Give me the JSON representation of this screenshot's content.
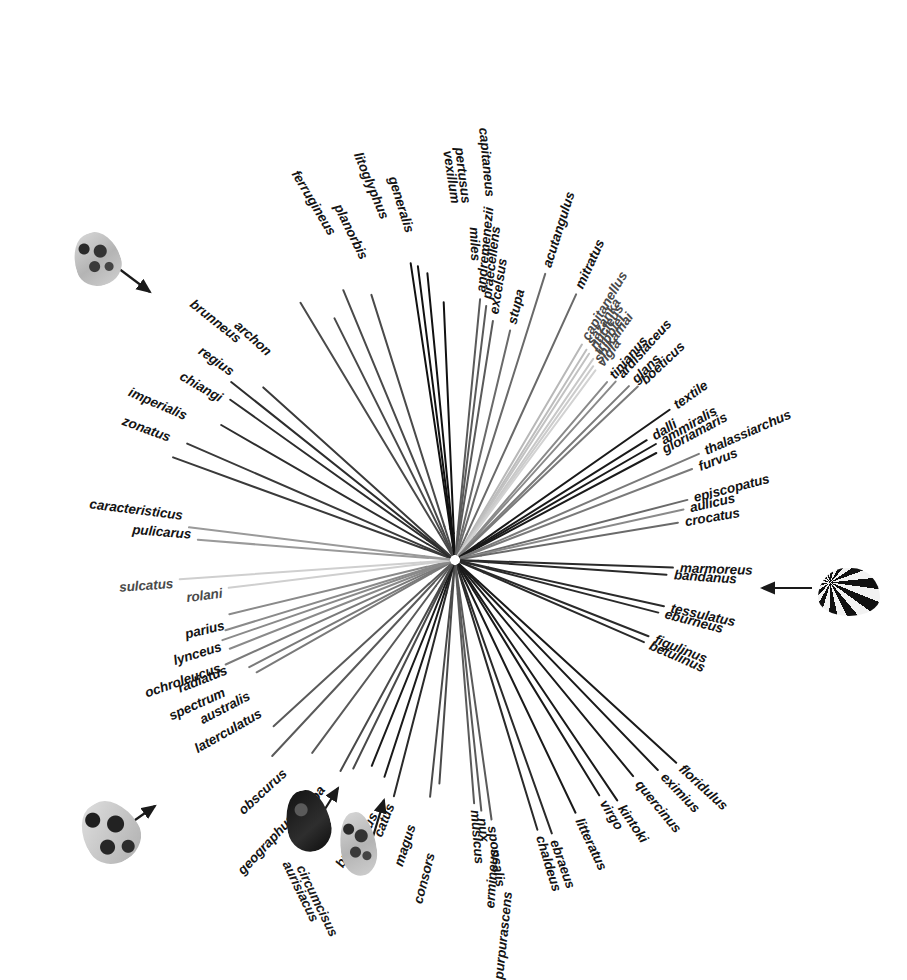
{
  "figure": {
    "type": "radial-phylogram",
    "background": "#ffffff",
    "center": [
      455,
      560
    ]
  },
  "chart_data": {
    "type": "diagram",
    "tip_count": 91,
    "tips": [
      {
        "label": "zonatus",
        "angle": 200.0,
        "radius": 300,
        "shade": "#3a3a3a"
      },
      {
        "label": "imperialis",
        "angle": 203.5,
        "radius": 292,
        "shade": "#3a3a3a"
      },
      {
        "label": "chiangi",
        "angle": 210.0,
        "radius": 270,
        "shade": "#2d2d2d"
      },
      {
        "label": "regius",
        "angle": 215.5,
        "radius": 276,
        "shade": "#2d2d2d"
      },
      {
        "label": "brunneus",
        "angle": 218.5,
        "radius": 286,
        "shade": "#2d2d2d"
      },
      {
        "label": "archon",
        "angle": 222.0,
        "radius": 258,
        "shade": "#3a3a3a"
      },
      {
        "label": "ferrugineus",
        "angle": 239.0,
        "radius": 300,
        "shade": "#4a4a4a"
      },
      {
        "label": "planorbis",
        "angle": 243.5,
        "radius": 270,
        "shade": "#4a4a4a"
      },
      {
        "label": "litoglyphus",
        "angle": 247.5,
        "radius": 292,
        "shade": "#4a4a4a"
      },
      {
        "label": "generalis",
        "angle": 252.5,
        "radius": 278,
        "shade": "#4a4a4a"
      },
      {
        "label": "vexillum",
        "angle": 261.5,
        "radius": 300,
        "shade": "#111111"
      },
      {
        "label": "pertusus",
        "angle": 262.8,
        "radius": 296,
        "shade": "#111111"
      },
      {
        "label": "capitaneus",
        "angle": 264.5,
        "radius": 288,
        "shade": "#111111"
      },
      {
        "label": "miles",
        "angle": 267.5,
        "radius": 258,
        "shade": "#111111"
      },
      {
        "label": "andremenezii",
        "angle": 275.5,
        "radius": 262,
        "shade": "#5a5a5a"
      },
      {
        "label": "praecellens",
        "angle": 277.0,
        "radius": 256,
        "shade": "#5a5a5a"
      },
      {
        "label": "excelsus",
        "angle": 279.0,
        "radius": 242,
        "shade": "#5a5a5a"
      },
      {
        "label": "stupa",
        "angle": 283.5,
        "radius": 236,
        "shade": "#6a6a6a"
      },
      {
        "label": "acutangulus",
        "angle": 287.5,
        "radius": 300,
        "shade": "#6a6a6a"
      },
      {
        "label": "mitratus",
        "angle": 294.5,
        "radius": 292,
        "shade": "#6a6a6a"
      },
      {
        "label": "capitanellus",
        "angle": 300.5,
        "radius": 250,
        "shade": "#b8b8b8"
      },
      {
        "label": "sazanka",
        "angle": 302.0,
        "radius": 248,
        "shade": "#bdbdbd"
      },
      {
        "label": "nucleus",
        "angle": 303.0,
        "radius": 246,
        "shade": "#c2c2c2"
      },
      {
        "label": "tribblei",
        "angle": 304.5,
        "radius": 244,
        "shade": "#c8c8c8"
      },
      {
        "label": "shikamai",
        "angle": 305.5,
        "radius": 238,
        "shade": "#cccccc"
      },
      {
        "label": "vigla",
        "angle": 306.5,
        "radius": 236,
        "shade": "#d2d2d2"
      },
      {
        "label": "tinianus",
        "angle": 310.5,
        "radius": 234,
        "shade": "#8a8a8a"
      },
      {
        "label": "ardisiaceus",
        "angle": 312.0,
        "radius": 240,
        "shade": "#8a8a8a"
      },
      {
        "label": "glans",
        "angle": 315.0,
        "radius": 246,
        "shade": "#7a7a7a"
      },
      {
        "label": "boeticus",
        "angle": 316.5,
        "radius": 252,
        "shade": "#7a7a7a"
      },
      {
        "label": "textile",
        "angle": 325.0,
        "radius": 262,
        "shade": "#1a1a1a"
      },
      {
        "label": "dalli",
        "angle": 328.0,
        "radius": 226,
        "shade": "#1a1a1a"
      },
      {
        "label": "ammiralis",
        "angle": 330.0,
        "radius": 232,
        "shade": "#1a1a1a"
      },
      {
        "label": "gloriamaris",
        "angle": 332.0,
        "radius": 228,
        "shade": "#1a1a1a"
      },
      {
        "label": "thalassiarchus",
        "angle": 336.5,
        "radius": 266,
        "shade": "#7a7a7a"
      },
      {
        "label": "furvus",
        "angle": 339.0,
        "radius": 254,
        "shade": "#7a7a7a"
      },
      {
        "label": "episcopatus",
        "angle": 345.5,
        "radius": 240,
        "shade": "#6a6a6a"
      },
      {
        "label": "aulicus",
        "angle": 347.5,
        "radius": 234,
        "shade": "#8a8a8a"
      },
      {
        "label": "crocatus",
        "angle": 350.5,
        "radius": 226,
        "shade": "#6a6a6a"
      },
      {
        "label": "marmoreus",
        "angle": 2.0,
        "radius": 218,
        "shade": "#2a2a2a"
      },
      {
        "label": "bandanus",
        "angle": 4.0,
        "radius": 212,
        "shade": "#2a2a2a"
      },
      {
        "label": "tessulatus",
        "angle": 12.5,
        "radius": 214,
        "shade": "#2a2a2a"
      },
      {
        "label": "eburneus",
        "angle": 14.5,
        "radius": 210,
        "shade": "#2a2a2a"
      },
      {
        "label": "figulinus",
        "angle": 21.5,
        "radius": 208,
        "shade": "#2a2a2a"
      },
      {
        "label": "betulinus",
        "angle": 23.5,
        "radius": 206,
        "shade": "#2a2a2a"
      },
      {
        "label": "floridulus",
        "angle": 42.5,
        "radius": 300,
        "shade": "#1a1a1a"
      },
      {
        "label": "eximius",
        "angle": 46.0,
        "radius": 292,
        "shade": "#1a1a1a"
      },
      {
        "label": "quercinus",
        "angle": 50.5,
        "radius": 280,
        "shade": "#1a1a1a"
      },
      {
        "label": "kintoki",
        "angle": 56.0,
        "radius": 290,
        "shade": "#1a1a1a"
      },
      {
        "label": "virgo",
        "angle": 58.5,
        "radius": 276,
        "shade": "#1a1a1a"
      },
      {
        "label": "litteratus",
        "angle": 64.5,
        "radius": 280,
        "shade": "#1a1a1a"
      },
      {
        "label": "ebraeus",
        "angle": 70.5,
        "radius": 290,
        "shade": "#2a2a2a"
      },
      {
        "label": "chaldeus",
        "angle": 73.0,
        "radius": 282,
        "shade": "#2a2a2a"
      },
      {
        "label": "sponsalis",
        "angle": 82.0,
        "radius": 262,
        "shade": "#5a5a5a"
      },
      {
        "label": "nux",
        "angle": 84.0,
        "radius": 252,
        "shade": "#5a5a5a"
      },
      {
        "label": "musicus",
        "angle": 85.5,
        "radius": 244,
        "shade": "#5a5a5a"
      },
      {
        "label": "ermineus",
        "angle": 94.0,
        "radius": 224,
        "shade": "#4a4a4a"
      },
      {
        "label": "purpurascens",
        "angle": 96.0,
        "radius": 238,
        "shade": "#4a4a4a"
      },
      {
        "label": "consors",
        "angle": 104.5,
        "radius": 244,
        "shade": "#2a2a2a"
      },
      {
        "label": "magus",
        "angle": 108.0,
        "radius": 228,
        "shade": "#1a1a1a"
      },
      {
        "label": "catus",
        "angle": 112.0,
        "radius": 222,
        "shade": "#1a1a1a"
      },
      {
        "label": "cervus",
        "angle": 116.0,
        "radius": 232,
        "shade": "#4a4a4a"
      },
      {
        "label": "bullatus",
        "angle": 118.5,
        "radius": 240,
        "shade": "#4a4a4a"
      },
      {
        "label": "tulipa",
        "angle": 126.5,
        "radius": 240,
        "shade": "#5a5a5a"
      },
      {
        "label": "geographus",
        "angle": 133.0,
        "radius": 268,
        "shade": "#5a5a5a"
      },
      {
        "label": "obscurus",
        "angle": 137.5,
        "radius": 246,
        "shade": "#5a5a5a"
      },
      {
        "label": "laterculatus",
        "angle": 150.5,
        "radius": 228,
        "shade": "#7a7a7a"
      },
      {
        "label": "australis",
        "angle": 152.5,
        "radius": 232,
        "shade": "#7a7a7a"
      },
      {
        "label": "spectrum",
        "angle": 155.5,
        "radius": 252,
        "shade": "#7a7a7a"
      },
      {
        "label": "radiatus",
        "angle": 158.5,
        "radius": 242,
        "shade": "#8a8a8a"
      },
      {
        "label": "ochroleucus",
        "angle": 161.0,
        "radius": 246,
        "shade": "#8a8a8a"
      },
      {
        "label": "lynceus",
        "angle": 163.0,
        "radius": 240,
        "shade": "#8a8a8a"
      },
      {
        "label": "parius",
        "angle": 166.5,
        "radius": 232,
        "shade": "#8a8a8a"
      },
      {
        "label": "rolani",
        "angle": 173.0,
        "radius": 228,
        "shade": "#cfcfcf"
      },
      {
        "label": "sulcatus",
        "angle": 176.0,
        "radius": 276,
        "shade": "#cfcfcf"
      },
      {
        "label": "pulicarus",
        "angle": 184.5,
        "radius": 258,
        "shade": "#9a9a9a"
      },
      {
        "label": "caracteristicus",
        "angle": 187.0,
        "radius": 268,
        "shade": "#9a9a9a"
      }
    ],
    "shell_images": [
      {
        "name": "brunneus-shell",
        "points_to": "brunneus",
        "x": 74,
        "y": 232,
        "w": 46,
        "h": 54,
        "pattern": "mottled-light",
        "rotation": -18
      },
      {
        "name": "marmoreus-shell",
        "points_to": "marmoreus",
        "x": 818,
        "y": 568,
        "w": 62,
        "h": 48,
        "pattern": "reticulated-dark",
        "rotation": 0
      },
      {
        "name": "geographus-shell",
        "points_to": "geographus",
        "x": 82,
        "y": 800,
        "w": 56,
        "h": 64,
        "pattern": "blotched-mid",
        "rotation": -32
      },
      {
        "name": "aurisiacus-shell",
        "points_to": "aurisiacus",
        "x": 286,
        "y": 790,
        "w": 44,
        "h": 62,
        "pattern": "solid-dark",
        "rotation": -12
      },
      {
        "name": "circumcisus-shell",
        "points_to": "circumcisus",
        "x": 340,
        "y": 812,
        "w": 36,
        "h": 64,
        "pattern": "mottled-light",
        "rotation": -8
      }
    ],
    "arrow_annotations": [
      {
        "name": "arrow-to-brunneus",
        "from": [
          118,
          268
        ],
        "to": [
          150,
          292
        ]
      },
      {
        "name": "arrow-to-marmoreus",
        "from": [
          812,
          588
        ],
        "to": [
          762,
          588
        ]
      },
      {
        "name": "arrow-to-geographus",
        "from": [
          118,
          832
        ],
        "to": [
          155,
          806
        ]
      },
      {
        "name": "arrow-to-aurisiacus",
        "from": [
          317,
          822
        ],
        "to": [
          338,
          788
        ]
      },
      {
        "name": "arrow-to-circumcisus",
        "from": [
          372,
          840
        ],
        "to": [
          384,
          800
        ]
      }
    ],
    "extra_labels": [
      {
        "label": "aurisiacus",
        "x": 286,
        "y": 862,
        "rotation": 64
      },
      {
        "label": "circumcisus",
        "x": 300,
        "y": 866,
        "rotation": 64
      }
    ]
  }
}
